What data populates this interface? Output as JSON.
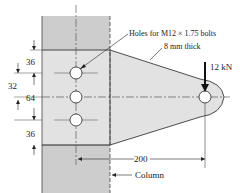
{
  "diagram": {
    "labels": {
      "holes": "Holes for M12 × 1.75 bolts",
      "thickness": "8 mm thick",
      "load": "12 kN",
      "span": "200",
      "column": "Column"
    },
    "dimensions": {
      "top": "36",
      "pitch": "32",
      "total": "64",
      "bottom": "36"
    },
    "colors": {
      "column_fill": "#cdcdcd",
      "plate_fill": "#e2e2e2",
      "line": "#222222"
    }
  }
}
